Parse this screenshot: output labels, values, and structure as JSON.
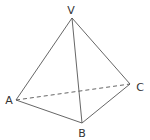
{
  "diagram": {
    "type": "tetrahedron",
    "vertices": [
      {
        "id": "V",
        "label": "V",
        "x": 72,
        "y": 18,
        "lx": 71,
        "ly": 14
      },
      {
        "id": "A",
        "label": "A",
        "x": 16,
        "y": 100,
        "lx": 9,
        "ly": 104
      },
      {
        "id": "B",
        "label": "B",
        "x": 82,
        "y": 123,
        "lx": 82,
        "ly": 137
      },
      {
        "id": "C",
        "label": "C",
        "x": 130,
        "y": 84,
        "lx": 140,
        "ly": 91
      }
    ],
    "edges": [
      {
        "from": "V",
        "to": "A",
        "style": "solid"
      },
      {
        "from": "V",
        "to": "B",
        "style": "solid"
      },
      {
        "from": "V",
        "to": "C",
        "style": "solid"
      },
      {
        "from": "A",
        "to": "B",
        "style": "solid"
      },
      {
        "from": "B",
        "to": "C",
        "style": "solid"
      },
      {
        "from": "A",
        "to": "C",
        "style": "dashed"
      }
    ],
    "line_color": "#555555"
  }
}
